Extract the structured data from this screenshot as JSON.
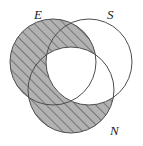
{
  "figure": {
    "name": "three-set-venn-diagram",
    "width": 143,
    "height": 146,
    "background_color": "#ffffff",
    "stroke_color": "#4d4d4d",
    "stroke_width": 1,
    "shade_fill_color": "#b0b0b0",
    "shade_hatch_color": "#555555",
    "unshaded_fill_color": "#ffffff"
  },
  "labels": {
    "set_e": "E",
    "set_s": "S",
    "set_n": "N"
  },
  "chart_data": {
    "type": "venn",
    "title": "",
    "sets": [
      {
        "id": "E",
        "label": "E",
        "cx": 53,
        "cy": 62,
        "r": 43
      },
      {
        "id": "S",
        "label": "S",
        "cx": 89,
        "cy": 62,
        "r": 43
      },
      {
        "id": "N",
        "label": "N",
        "cx": 71,
        "cy": 90,
        "r": 43
      }
    ],
    "regions": [
      {
        "id": "E-only",
        "sets": [
          "E"
        ],
        "shaded": true,
        "pattern": "diagonal-hatch"
      },
      {
        "id": "S-only",
        "sets": [
          "S"
        ],
        "shaded": false,
        "pattern": "none"
      },
      {
        "id": "N-only",
        "sets": [
          "N"
        ],
        "shaded": true,
        "pattern": "diagonal-hatch"
      },
      {
        "id": "E-and-S",
        "sets": [
          "E",
          "S"
        ],
        "shaded": true,
        "pattern": "diagonal-hatch"
      },
      {
        "id": "E-and-N",
        "sets": [
          "E",
          "N"
        ],
        "shaded": true,
        "pattern": "diagonal-hatch"
      },
      {
        "id": "S-and-N",
        "sets": [
          "S",
          "N"
        ],
        "shaded": false,
        "pattern": "none"
      },
      {
        "id": "E-and-S-and-N",
        "sets": [
          "E",
          "S",
          "N"
        ],
        "shaded": false,
        "pattern": "none"
      }
    ],
    "shaded_expression": "E ∪ (N − S)",
    "legend": {
      "shown": false,
      "position": "none"
    },
    "label_positions": [
      {
        "text": "E",
        "x": 34,
        "y": 8,
        "align": "outside-top-left"
      },
      {
        "text": "S",
        "x": 107,
        "y": 8,
        "align": "outside-top-right"
      },
      {
        "text": "N",
        "x": 110,
        "y": 124,
        "align": "outside-bottom-right"
      }
    ]
  }
}
